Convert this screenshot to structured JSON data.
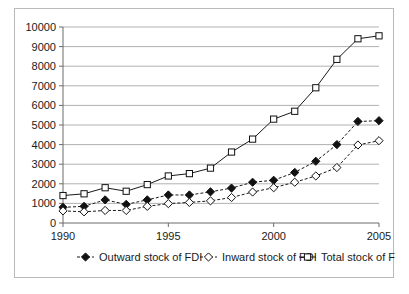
{
  "chart_data": {
    "type": "line",
    "title": "",
    "xlabel": "",
    "ylabel": "",
    "x": [
      1990,
      1991,
      1992,
      1993,
      1994,
      1995,
      1996,
      1997,
      1998,
      1999,
      2000,
      2001,
      2002,
      2003,
      2004,
      2005
    ],
    "tick_labels_x": [
      "1990",
      "1995",
      "2000",
      "2005"
    ],
    "tick_values_x": [
      1990,
      1995,
      2000,
      2005
    ],
    "tick_labels_y": [
      "0",
      "1000",
      "2000",
      "3000",
      "4000",
      "5000",
      "6000",
      "7000",
      "8000",
      "9000",
      "10000"
    ],
    "tick_values_y": [
      0,
      1000,
      2000,
      3000,
      4000,
      5000,
      6000,
      7000,
      8000,
      9000,
      10000
    ],
    "xlim": [
      1990,
      2005
    ],
    "ylim": [
      0,
      10000
    ],
    "grid": true,
    "legend_position": "bottom",
    "series": [
      {
        "name": "Outward stock of FDI",
        "marker": "filled-diamond",
        "line": "dashed",
        "values": [
          800,
          850,
          1180,
          950,
          1180,
          1430,
          1430,
          1590,
          1780,
          2080,
          2180,
          2580,
          3150,
          4000,
          5180,
          5220
        ]
      },
      {
        "name": "Inward stock of FDI",
        "marker": "open-diamond",
        "line": "dashed",
        "values": [
          620,
          570,
          640,
          640,
          850,
          990,
          1050,
          1130,
          1300,
          1580,
          1800,
          2080,
          2400,
          2830,
          3980,
          4200
        ]
      },
      {
        "name": "Total stock of FDI",
        "marker": "open-square",
        "line": "solid",
        "values": [
          1400,
          1490,
          1800,
          1620,
          1960,
          2400,
          2520,
          2800,
          3620,
          4280,
          5300,
          5700,
          6900,
          8350,
          9400,
          9550
        ]
      }
    ]
  },
  "legend": {
    "items": [
      {
        "label": "Outward stock of FDI",
        "marker": "filled-diamond"
      },
      {
        "label": "Inward stock of FDI",
        "marker": "open-diamond"
      },
      {
        "label": "Total stock of FDI",
        "marker": "open-square"
      }
    ]
  }
}
